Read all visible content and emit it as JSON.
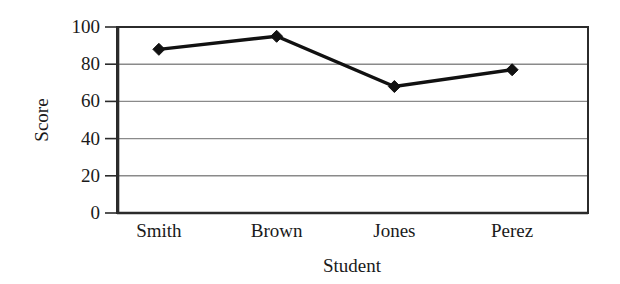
{
  "chart_data": {
    "type": "line",
    "title": "",
    "subtitle": "",
    "xlabel": "Student",
    "ylabel": "Score",
    "categories": [
      "Smith",
      "Brown",
      "Jones",
      "Perez"
    ],
    "values": [
      88,
      95,
      68,
      77
    ],
    "series": [
      {
        "name": "Score",
        "values": [
          88,
          95,
          68,
          77
        ]
      }
    ],
    "ylim": [
      0,
      100
    ],
    "yticks": [
      0,
      20,
      40,
      60,
      80,
      100
    ],
    "ytick_labels": [
      "0",
      "20",
      "40",
      "60",
      "80",
      "100"
    ],
    "grid": "horizontal",
    "legend": "none",
    "marker": "diamond",
    "line_color": "#111111",
    "marker_color": "#111111",
    "grid_color": "#8a8a8a",
    "axis_color": "#2b2b2b",
    "background": "#ffffff",
    "annotations": []
  },
  "axes": {
    "y_title": "Score",
    "x_title": "Student"
  }
}
